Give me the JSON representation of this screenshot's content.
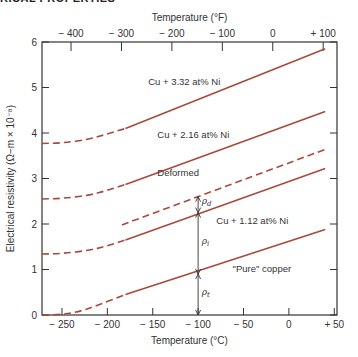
{
  "header": {
    "text": "RICAL PROPERTIES"
  },
  "chart_data": {
    "type": "line",
    "title": "",
    "xlabel": "Temperature (°C)",
    "x2label": "Temperature (°F)",
    "ylabel": "Electrical resistivity (Ω−m × 10⁻⁸)",
    "xlim": [
      -272,
      53
    ],
    "ylim": [
      0,
      6
    ],
    "xticks": [
      -250,
      -200,
      -150,
      -100,
      -50,
      0,
      50
    ],
    "xtick_labels": [
      "− 250",
      "− 200",
      "− 150",
      "− 100",
      "− 50",
      "0",
      "+ 50"
    ],
    "x2ticks_F": [
      -400,
      -300,
      -200,
      -100,
      0,
      100
    ],
    "x2tick_labels": [
      "− 400",
      "− 300",
      "− 200",
      "− 100",
      "0",
      "+ 100"
    ],
    "yticks": [
      0,
      1,
      2,
      3,
      4,
      5,
      6
    ],
    "ytick_labels": [
      "0",
      "1",
      "2",
      "3",
      "4",
      "5",
      "6"
    ],
    "grid": false,
    "line_color": "#a9483d",
    "series": [
      {
        "name": "Cu + 3.32 at% Ni",
        "dashed_x": [
          -272,
          -250,
          -220,
          -200,
          -180
        ],
        "dashed_y": [
          3.77,
          3.78,
          3.86,
          3.98,
          4.1
        ],
        "solid_x": [
          -180,
          40
        ],
        "solid_y": [
          4.1,
          5.85
        ]
      },
      {
        "name": "Cu + 2.16 at% Ni",
        "dashed_x": [
          -272,
          -250,
          -220,
          -200,
          -180
        ],
        "dashed_y": [
          2.55,
          2.56,
          2.63,
          2.74,
          2.87
        ],
        "solid_x": [
          -180,
          40
        ],
        "solid_y": [
          2.87,
          4.47
        ]
      },
      {
        "name": "Deformed",
        "dashed_x": [
          -184,
          40
        ],
        "dashed_y": [
          1.98,
          3.64
        ],
        "solid_x": [],
        "solid_y": []
      },
      {
        "name": "Cu + 1.12 at% Ni",
        "dashed_x": [
          -272,
          -250,
          -220,
          -200,
          -180
        ],
        "dashed_y": [
          1.34,
          1.35,
          1.42,
          1.52,
          1.65
        ],
        "solid_x": [
          -180,
          40
        ],
        "solid_y": [
          1.65,
          3.22
        ]
      },
      {
        "name": "\"Pure\" copper",
        "dashed_x": [
          -272,
          -250,
          -230,
          -210,
          -180
        ],
        "dashed_y": [
          0.0,
          0.01,
          0.08,
          0.22,
          0.45
        ],
        "solid_x": [
          -180,
          40
        ],
        "solid_y": [
          0.45,
          1.88
        ]
      }
    ],
    "annotations": [
      {
        "text": "Cu + 3.32 at% Ni",
        "x": -155,
        "y": 5.05
      },
      {
        "text": "Cu + 2.16 at% Ni",
        "x": -145,
        "y": 3.88
      },
      {
        "text": "Deformed",
        "x": -145,
        "y": 3.05
      },
      {
        "text": "Cu + 1.12 at% Ni",
        "x": -80,
        "y": 2.0
      },
      {
        "text": "\"Pure\" copper",
        "x": -62,
        "y": 0.95
      },
      {
        "text": "ρd",
        "x": -96,
        "y": 2.43,
        "arrow": "between Deformed and Cu+1.12 at -100°C"
      },
      {
        "text": "ρi",
        "x": -96,
        "y": 1.55,
        "arrow": "between Cu+1.12 and Pure copper at -100°C"
      },
      {
        "text": "ρt",
        "x": -96,
        "y": 0.45,
        "arrow": "between Pure copper and 0 at -100°C"
      }
    ],
    "arrow_x": -100,
    "arrow_levels": {
      "deformed": 2.6,
      "ni112": 2.25,
      "pure": 0.9,
      "zero": 0
    }
  }
}
